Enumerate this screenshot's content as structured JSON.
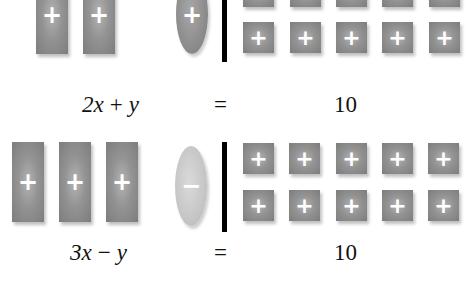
{
  "equation_1": {
    "lhs_label": "2x + y",
    "lhs_parts": [
      "2x",
      "+",
      "y"
    ],
    "equals": "=",
    "rhs_label": "10",
    "x_tiles": [
      {
        "sign": "+"
      },
      {
        "sign": "+"
      }
    ],
    "y_tiles": [
      {
        "sign": "+"
      }
    ],
    "unit_tiles": [
      "+",
      "+",
      "+",
      "+",
      "+",
      "+",
      "+",
      "+",
      "+",
      "+"
    ]
  },
  "equation_2": {
    "lhs_label": "3x − y",
    "lhs_parts": [
      "3x",
      "−",
      "y"
    ],
    "equals": "=",
    "rhs_label": "10",
    "x_tiles": [
      {
        "sign": "+"
      },
      {
        "sign": "+"
      },
      {
        "sign": "+"
      }
    ],
    "y_tiles": [
      {
        "sign": "−"
      }
    ],
    "unit_tiles": [
      "+",
      "+",
      "+",
      "+",
      "+",
      "+",
      "+",
      "+",
      "+",
      "+"
    ]
  },
  "colors": {
    "tile_positive": "#8c8c8c",
    "tile_negative": "#c6c6c6",
    "sign": "#ffffff",
    "divider": "#000000",
    "text": "#111111"
  }
}
